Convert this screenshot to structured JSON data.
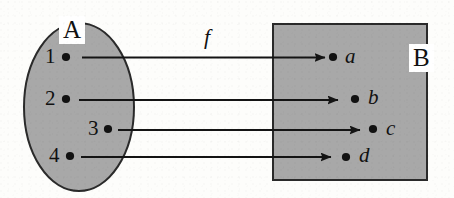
{
  "figure": {
    "type": "function-mapping-diagram",
    "map_label": "f",
    "domain_set": {
      "name": "A",
      "shape": "ellipse",
      "fill_color": "#a8a8a8",
      "stroke_color": "#2b2b2b",
      "elements": [
        {
          "label": "1",
          "dot": true
        },
        {
          "label": "2",
          "dot": true
        },
        {
          "label": "3",
          "dot": true
        },
        {
          "label": "4",
          "dot": true
        }
      ]
    },
    "codomain_set": {
      "name": "B",
      "shape": "rectangle",
      "fill_color": "#a8a8a8",
      "stroke_color": "#2b2b2b",
      "elements": [
        {
          "label": "a",
          "dot": true
        },
        {
          "label": "b",
          "dot": true
        },
        {
          "label": "c",
          "dot": true
        },
        {
          "label": "d",
          "dot": true
        }
      ]
    },
    "arrows": [
      {
        "from": "1",
        "to": "a"
      },
      {
        "from": "2",
        "to": "b"
      },
      {
        "from": "3",
        "to": "c"
      },
      {
        "from": "4",
        "to": "d"
      }
    ]
  }
}
